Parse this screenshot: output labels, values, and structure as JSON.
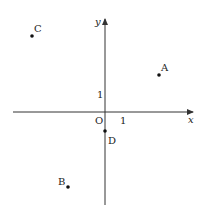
{
  "diagram": {
    "type": "coordinate-plane",
    "origin_label": "O",
    "x_axis_label": "x",
    "y_axis_label": "y",
    "unit_x_label": "1",
    "unit_y_label": "1",
    "points": [
      {
        "name": "A",
        "x": 3,
        "y": 2
      },
      {
        "name": "B",
        "x": -2,
        "y": -4
      },
      {
        "name": "C",
        "x": -4,
        "y": 4
      },
      {
        "name": "D",
        "x": 0,
        "y": -1
      }
    ],
    "colors": {
      "axis": "#333333",
      "point": "#111111",
      "text": "#222222"
    }
  }
}
